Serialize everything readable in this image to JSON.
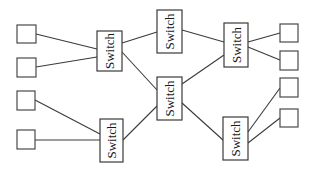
{
  "diagram": {
    "type": "network-topology",
    "background": "#ffffff",
    "stroke_color": "#3a3a3a",
    "switch_label": "Switch",
    "switches": [
      {
        "id": "s1",
        "label": "Switch",
        "x": 97,
        "y": 31,
        "w": 25,
        "h": 40
      },
      {
        "id": "s2",
        "label": "Switch",
        "x": 100,
        "y": 119,
        "w": 23,
        "h": 43
      },
      {
        "id": "s3",
        "label": "Switch",
        "x": 157,
        "y": 10,
        "w": 25,
        "h": 43
      },
      {
        "id": "s4",
        "label": "Switch",
        "x": 157,
        "y": 77,
        "w": 25,
        "h": 43
      },
      {
        "id": "s5",
        "label": "Switch",
        "x": 224,
        "y": 23,
        "w": 24,
        "h": 44
      },
      {
        "id": "s6",
        "label": "Switch",
        "x": 223,
        "y": 117,
        "w": 25,
        "h": 43
      }
    ],
    "hosts": [
      {
        "id": "h1",
        "x": 17,
        "y": 25,
        "w": 19,
        "h": 18
      },
      {
        "id": "h2",
        "x": 17,
        "y": 58,
        "w": 19,
        "h": 19
      },
      {
        "id": "h3",
        "x": 17,
        "y": 91,
        "w": 18,
        "h": 19
      },
      {
        "id": "h4",
        "x": 17,
        "y": 130,
        "w": 18,
        "h": 19
      },
      {
        "id": "h5",
        "x": 280,
        "y": 24,
        "w": 18,
        "h": 18
      },
      {
        "id": "h6",
        "x": 280,
        "y": 51,
        "w": 18,
        "h": 19
      },
      {
        "id": "h7",
        "x": 280,
        "y": 78,
        "w": 18,
        "h": 19
      },
      {
        "id": "h8",
        "x": 280,
        "y": 109,
        "w": 18,
        "h": 18
      }
    ],
    "links": [
      {
        "from": "h1",
        "to": "s1",
        "x1": 36,
        "y1": 34,
        "x2": 97,
        "y2": 49
      },
      {
        "from": "h2",
        "to": "s1",
        "x1": 36,
        "y1": 67,
        "x2": 97,
        "y2": 57
      },
      {
        "from": "h3",
        "to": "s2",
        "x1": 35,
        "y1": 100,
        "x2": 100,
        "y2": 134
      },
      {
        "from": "h4",
        "to": "s2",
        "x1": 35,
        "y1": 140,
        "x2": 100,
        "y2": 140
      },
      {
        "from": "s1",
        "to": "s3",
        "x1": 122,
        "y1": 43,
        "x2": 157,
        "y2": 32
      },
      {
        "from": "s1",
        "to": "s4",
        "x1": 122,
        "y1": 52,
        "x2": 157,
        "y2": 90
      },
      {
        "from": "s2",
        "to": "s4",
        "x1": 123,
        "y1": 140,
        "x2": 157,
        "y2": 106
      },
      {
        "from": "s3",
        "to": "s5",
        "x1": 182,
        "y1": 30,
        "x2": 224,
        "y2": 42
      },
      {
        "from": "s4",
        "to": "s5",
        "x1": 182,
        "y1": 84,
        "x2": 224,
        "y2": 55
      },
      {
        "from": "s4",
        "to": "s6",
        "x1": 182,
        "y1": 103,
        "x2": 223,
        "y2": 140
      },
      {
        "from": "s5",
        "to": "h5",
        "x1": 248,
        "y1": 42,
        "x2": 280,
        "y2": 33
      },
      {
        "from": "s5",
        "to": "h6",
        "x1": 248,
        "y1": 47,
        "x2": 280,
        "y2": 60
      },
      {
        "from": "s6",
        "to": "h7",
        "x1": 248,
        "y1": 132,
        "x2": 280,
        "y2": 88
      },
      {
        "from": "s6",
        "to": "h8",
        "x1": 248,
        "y1": 143,
        "x2": 280,
        "y2": 118
      }
    ]
  }
}
